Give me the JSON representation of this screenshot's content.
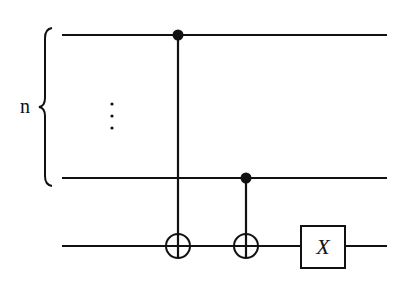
{
  "diagram": {
    "type": "quantum-circuit",
    "register_label": "n",
    "ellipsis": "⋮",
    "gates": [
      {
        "type": "CNOT",
        "control_qubit": "top",
        "target_qubit": "ancilla"
      },
      {
        "type": "CNOT",
        "control_qubit": "n-th",
        "target_qubit": "ancilla"
      },
      {
        "type": "X",
        "label": "X",
        "target_qubit": "ancilla"
      }
    ],
    "x_gate_label": "X",
    "colors": {
      "line": "#111111",
      "background": "#ffffff"
    }
  }
}
